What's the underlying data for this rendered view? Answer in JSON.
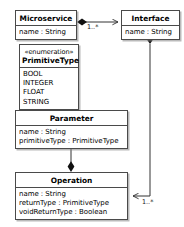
{
  "diagram": {
    "type": "uml-class-diagram",
    "background_color": "#ffffff",
    "line_color": "#4a4a4a",
    "text_color": "#000000"
  },
  "classes": {
    "microservice": {
      "name": "Microservice",
      "stereotype": "",
      "attributes": [
        "name : String"
      ]
    },
    "interface": {
      "name": "Interface",
      "stereotype": "",
      "attributes": [
        "name : String"
      ]
    },
    "primitive_type": {
      "name": "PrimitiveType",
      "stereotype": "«enumeration»",
      "attributes": [
        "BOOL",
        "INTEGER",
        "FLOAT",
        "STRING"
      ]
    },
    "parameter": {
      "name": "Parameter",
      "stereotype": "",
      "attributes": [
        "name : String",
        "primitiveType : PrimitiveType"
      ]
    },
    "operation": {
      "name": "Operation",
      "stereotype": "",
      "attributes": [
        "name : String",
        "returnType : PrimitiveType",
        "voidReturnType : Boolean"
      ]
    }
  },
  "relationships": [
    {
      "id": "microservice-interface",
      "from": "Microservice",
      "to": "Interface",
      "kind": "composition",
      "source_decoration": "filled-diamond",
      "target_decoration": "open-arrow",
      "multiplicity": "1..*"
    },
    {
      "id": "interface-operation",
      "from": "Interface",
      "to": "Operation",
      "kind": "composition",
      "source_decoration": "filled-diamond",
      "target_decoration": "open-arrow",
      "multiplicity": "1..*"
    },
    {
      "id": "operation-parameter",
      "from": "Operation",
      "to": "Parameter",
      "kind": "composition",
      "source_decoration": "filled-diamond",
      "target_decoration": "open-arrow",
      "multiplicity": ""
    }
  ]
}
